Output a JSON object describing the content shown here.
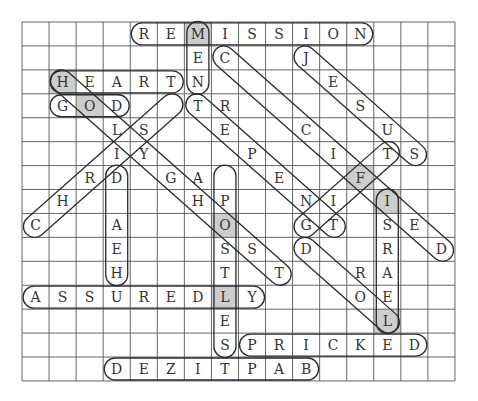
{
  "puzzle": {
    "title": "Word search",
    "cols": 16,
    "rows": 15,
    "grid": [
      "    REMISSION   ",
      "      EC  J     ",
      " HEARTN    E    ",
      " GOD  TR    S   ",
      "   LS  E  C  U  ",
      "   IY   P  I TS ",
      "  RD GA  E  F   ",
      " H    HP  NI I  ",
      "C  A   O  GT SE ",
      "   E   SS D  R D",
      "   H   T T  RA  ",
      "ASSUREDLY   OE  ",
      "       E     L  ",
      "       SPRICKED ",
      "   DEZITPAB     "
    ],
    "shaded_cells": [
      [
        0,
        6
      ],
      [
        2,
        1
      ],
      [
        3,
        2
      ],
      [
        6,
        12
      ],
      [
        7,
        13
      ],
      [
        8,
        7
      ],
      [
        11,
        7
      ],
      [
        12,
        13
      ]
    ],
    "shade_color": "#cdcdcd",
    "found_words": [
      {
        "word": "REMISSION",
        "start": [
          0,
          4
        ],
        "end": [
          0,
          12
        ]
      },
      {
        "word": "MEN",
        "start": [
          0,
          6
        ],
        "end": [
          2,
          6
        ]
      },
      {
        "word": "HEART",
        "start": [
          2,
          1
        ],
        "end": [
          2,
          5
        ]
      },
      {
        "word": "GOD",
        "start": [
          3,
          1
        ],
        "end": [
          3,
          3
        ]
      },
      {
        "word": "CHRIST",
        "start": [
          8,
          0
        ],
        "end": [
          3,
          5
        ]
      },
      {
        "word": "HOLY GHOST",
        "start": [
          2,
          1
        ],
        "end": [
          10,
          9
        ]
      },
      {
        "word": "REPENT",
        "start": [
          3,
          6
        ],
        "end": [
          8,
          11
        ]
      },
      {
        "word": "CRUCIFIED",
        "start": [
          1,
          7
        ],
        "end": [
          9,
          15
        ]
      },
      {
        "word": "JESUS",
        "start": [
          1,
          10
        ],
        "end": [
          5,
          14
        ]
      },
      {
        "word": "GIFT",
        "start": [
          8,
          10
        ],
        "end": [
          5,
          13
        ]
      },
      {
        "word": "HEARD",
        "start": [
          10,
          3
        ],
        "end": [
          6,
          3
        ]
      },
      {
        "word": "APOSTLES",
        "start": [
          6,
          7
        ],
        "end": [
          13,
          7
        ]
      },
      {
        "word": "ISRAEL",
        "start": [
          7,
          13
        ],
        "end": [
          12,
          13
        ]
      },
      {
        "word": "LORD",
        "start": [
          12,
          13
        ],
        "end": [
          9,
          10
        ]
      },
      {
        "word": "ASSUREDLY",
        "start": [
          11,
          0
        ],
        "end": [
          11,
          8
        ]
      },
      {
        "word": "PRICKED",
        "start": [
          13,
          8
        ],
        "end": [
          13,
          14
        ]
      },
      {
        "word": "BAPTIZED",
        "start": [
          14,
          10
        ],
        "end": [
          14,
          3
        ]
      }
    ]
  }
}
